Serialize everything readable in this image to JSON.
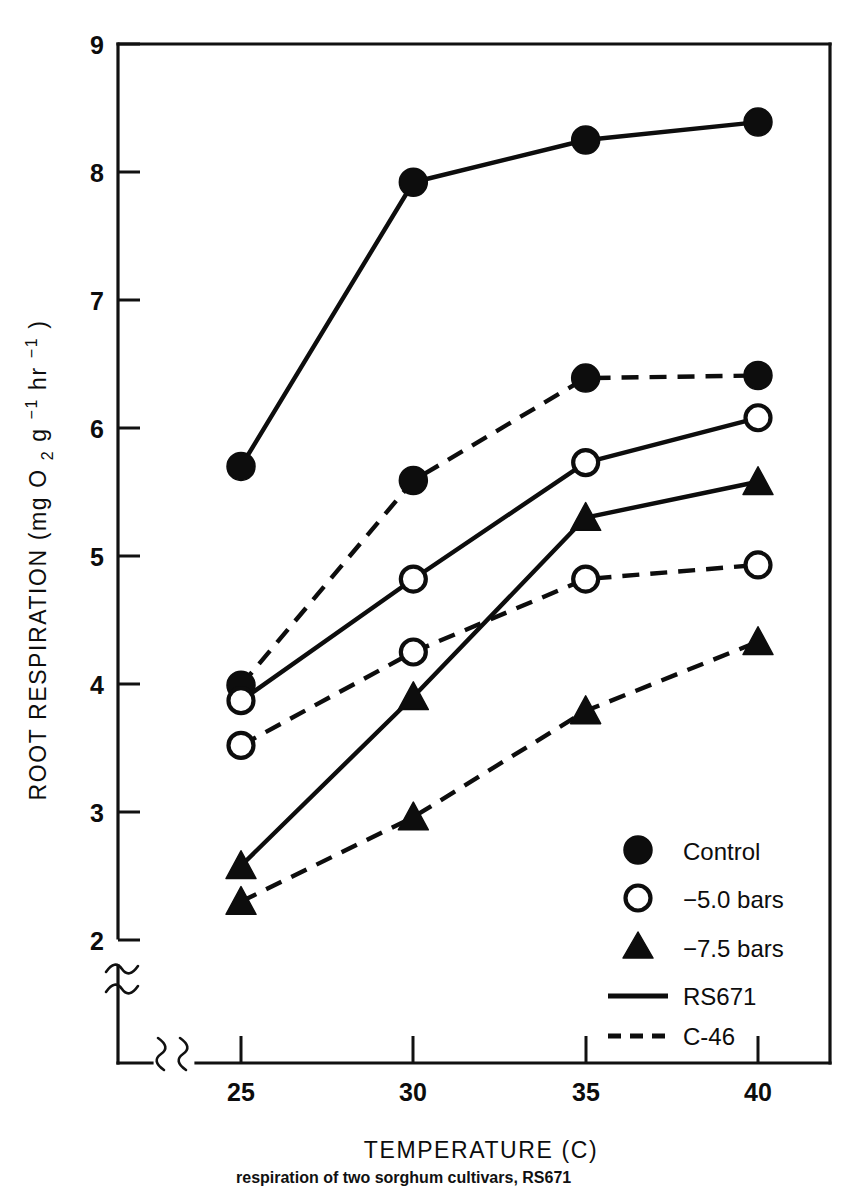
{
  "chart_data": {
    "type": "line",
    "title": "",
    "xlabel": "TEMPERATURE (C)",
    "ylabel": "ROOT RESPIRATION (mg O2 g-1 hr-1)",
    "ylabel_parts": {
      "main": "ROOT RESPIRATION",
      "unit_open": "(mg O",
      "unit_sub_2": "2",
      "unit_g": " g",
      "unit_sup_1a": "−1",
      "unit_hr": " hr",
      "unit_sup_1b": "−1",
      "unit_close": ")"
    },
    "x": [
      25,
      30,
      35,
      40
    ],
    "xticklabels": [
      "25",
      "30",
      "35",
      "40"
    ],
    "yticklabels": [
      "2",
      "3",
      "4",
      "5",
      "6",
      "7",
      "8",
      "9"
    ],
    "yticks": [
      2,
      3,
      4,
      5,
      6,
      7,
      8,
      9
    ],
    "xlim": [
      25,
      40
    ],
    "ylim": [
      2,
      9
    ],
    "grid": false,
    "axis_break_x": true,
    "axis_break_y": true,
    "legend_position": "lower right",
    "series": [
      {
        "name": "RS671 Control",
        "cultivar": "RS671",
        "treatment": "Control",
        "marker": "filled-circle",
        "linestyle": "solid",
        "values": [
          5.7,
          7.92,
          8.25,
          8.39
        ]
      },
      {
        "name": "C-46 Control",
        "cultivar": "C-46",
        "treatment": "Control",
        "marker": "filled-circle",
        "linestyle": "dashed",
        "values": [
          3.99,
          5.59,
          6.39,
          6.41
        ]
      },
      {
        "name": "RS671 -5.0 bars",
        "cultivar": "RS671",
        "treatment": "−5.0 bars",
        "marker": "open-circle",
        "linestyle": "solid",
        "values": [
          3.87,
          4.82,
          5.73,
          6.08
        ]
      },
      {
        "name": "C-46 -5.0 bars",
        "cultivar": "C-46",
        "treatment": "−5.0 bars",
        "marker": "open-circle",
        "linestyle": "dashed",
        "values": [
          3.52,
          4.25,
          4.82,
          4.93
        ]
      },
      {
        "name": "RS671 -7.5 bars",
        "cultivar": "RS671",
        "treatment": "−7.5 bars",
        "marker": "filled-triangle",
        "linestyle": "solid",
        "values": [
          2.58,
          3.9,
          5.3,
          5.58
        ]
      },
      {
        "name": "C-46 -7.5 bars",
        "cultivar": "C-46",
        "treatment": "−7.5 bars",
        "marker": "filled-triangle",
        "linestyle": "dashed",
        "values": [
          2.3,
          2.96,
          3.79,
          4.33
        ]
      }
    ],
    "legend": [
      {
        "label": "Control",
        "symbol": "filled-circle"
      },
      {
        "label": "−5.0 bars",
        "symbol": "open-circle"
      },
      {
        "label": "−7.5 bars",
        "symbol": "filled-triangle"
      },
      {
        "label": "RS671",
        "symbol": "solid-line"
      },
      {
        "label": "C-46",
        "symbol": "dashed-line"
      }
    ],
    "colors": {
      "ink": "#0d0d0d",
      "background": "#ffffff"
    }
  },
  "caption": {
    "text": "respiration of two sorghum cultivars, RS671"
  }
}
